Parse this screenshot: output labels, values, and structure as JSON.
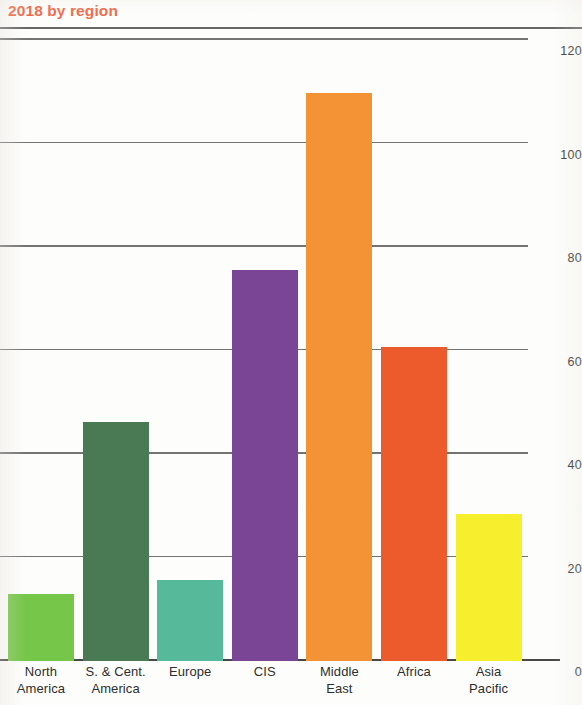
{
  "chart_title": "2018 by region",
  "title_color": "#ef6a4c",
  "chart_data": {
    "type": "bar",
    "title": "2018 by region",
    "xlabel": "",
    "ylabel": "",
    "ylim": [
      0,
      120
    ],
    "yticks": [
      0,
      20,
      40,
      60,
      80,
      100,
      120
    ],
    "ytick_labels": [
      "0",
      "20",
      "40",
      "60",
      "80",
      "100",
      "120"
    ],
    "grid": true,
    "legend": "none",
    "categories": [
      "North America",
      "S. & Cent. America",
      "Europe",
      "CIS",
      "Middle East",
      "Africa",
      "Asia Pacific"
    ],
    "category_lines": [
      [
        "North",
        "America"
      ],
      [
        "S. & Cent.",
        "America"
      ],
      [
        "Europe",
        ""
      ],
      [
        "CIS",
        ""
      ],
      [
        "Middle",
        "East"
      ],
      [
        "Africa",
        ""
      ],
      [
        "Asia",
        "Pacific"
      ]
    ],
    "values": [
      12.9,
      46.2,
      15.6,
      75.6,
      109.8,
      60.6,
      28.5
    ],
    "colors": [
      "#76c947",
      "#477a52",
      "#54bc9c",
      "#7b4397",
      "#f79433",
      "#f05a2a",
      "#fbf32a"
    ]
  },
  "axis": {
    "tick_0": "0",
    "tick_20": "20",
    "tick_40": "40",
    "tick_60": "60",
    "tick_80": "80",
    "tick_100": "100",
    "tick_120": "120"
  }
}
